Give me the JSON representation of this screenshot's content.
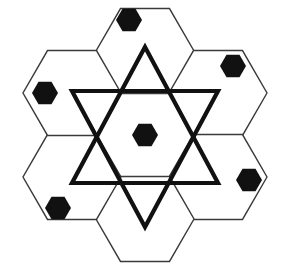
{
  "figure": {
    "width": 284,
    "height": 273,
    "background_color": "#ffffff",
    "center": {
      "x": 145,
      "y": 135
    }
  },
  "style": {
    "hex_stroke_color": "#3a3a3a",
    "hex_stroke_width": 1.4,
    "hex_fill_color": "#ffffff",
    "star_stroke_color": "#111111",
    "star_stroke_width": 4.2,
    "marker_fill_color": "#111111",
    "marker_radius": 12.5
  },
  "hex_grid": {
    "orientation": "flat-top",
    "cell_radius": 49,
    "cell_count": 7,
    "cells": [
      {
        "name": "center",
        "cx": 145,
        "cy": 135
      },
      {
        "name": "top",
        "cx": 145,
        "cy": 51
      },
      {
        "name": "top-right",
        "cx": 218,
        "cy": 93
      },
      {
        "name": "bottom-right",
        "cx": 218,
        "cy": 177
      },
      {
        "name": "bottom",
        "cx": 145,
        "cy": 219
      },
      {
        "name": "bottom-left",
        "cx": 72,
        "cy": 177
      },
      {
        "name": "top-left",
        "cx": 72,
        "cy": 93
      }
    ]
  },
  "star": {
    "name": "star-of-david",
    "up_triangle": {
      "label": "upward-triangle",
      "points": [
        {
          "x": 145,
          "y": 47
        },
        {
          "x": 218,
          "y": 183
        },
        {
          "x": 72,
          "y": 183
        }
      ]
    },
    "down_triangle": {
      "label": "downward-triangle",
      "points": [
        {
          "x": 72,
          "y": 91
        },
        {
          "x": 218,
          "y": 91
        },
        {
          "x": 145,
          "y": 227
        }
      ]
    }
  },
  "markers": {
    "label": "black hexagon markers",
    "count": 6,
    "shape": "hexagon",
    "items": [
      {
        "name": "marker-center",
        "cx": 145,
        "cy": 135,
        "r": 13
      },
      {
        "name": "marker-top",
        "cx": 129,
        "cy": 20,
        "r": 13
      },
      {
        "name": "marker-top-right",
        "cx": 233,
        "cy": 66,
        "r": 13
      },
      {
        "name": "marker-left",
        "cx": 45,
        "cy": 93,
        "r": 13
      },
      {
        "name": "marker-bottom-left",
        "cx": 58,
        "cy": 208,
        "r": 13
      },
      {
        "name": "marker-bottom-right",
        "cx": 249,
        "cy": 180,
        "r": 13
      }
    ]
  },
  "empty_cells": [
    {
      "name": "bottom",
      "has_marker": false
    }
  ]
}
